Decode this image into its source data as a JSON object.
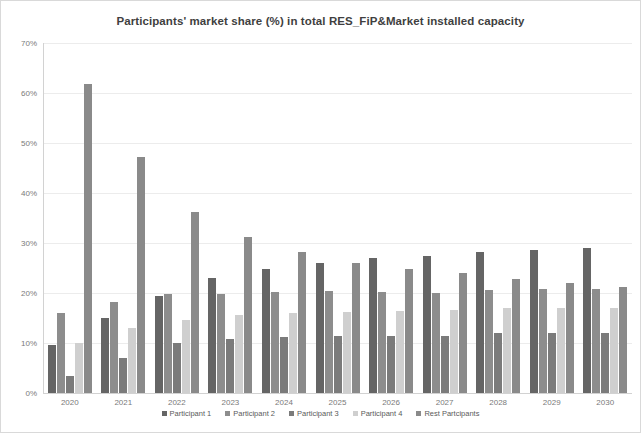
{
  "chart_data": {
    "type": "bar",
    "title": "Participants' market share (%) in total RES_FiP&Market installed capacity",
    "xlabel": "",
    "ylabel": "",
    "ylim": [
      0,
      70
    ],
    "yticks": [
      "0%",
      "10%",
      "20%",
      "30%",
      "40%",
      "50%",
      "60%",
      "70%"
    ],
    "ytick_values": [
      0,
      10,
      20,
      30,
      40,
      50,
      60,
      70
    ],
    "grid": true,
    "legend_position": "bottom",
    "categories": [
      "2020",
      "2021",
      "2022",
      "2023",
      "2024",
      "2025",
      "2026",
      "2027",
      "2028",
      "2029",
      "2030"
    ],
    "series": [
      {
        "name": "Participant 1",
        "color": "#656565",
        "values": [
          9.7,
          15.0,
          19.5,
          23.0,
          24.8,
          26.0,
          27.0,
          27.5,
          28.2,
          28.7,
          29.0
        ]
      },
      {
        "name": "Participant 2",
        "color": "#8d8d8d",
        "values": [
          16.0,
          18.3,
          19.8,
          19.9,
          20.2,
          20.5,
          20.3,
          20.1,
          20.6,
          20.8,
          20.8
        ]
      },
      {
        "name": "Participant 3",
        "color": "#7b7b7b",
        "values": [
          3.5,
          7.0,
          10.0,
          10.8,
          11.3,
          11.5,
          11.4,
          11.4,
          12.0,
          12.0,
          12.0
        ]
      },
      {
        "name": "Participant 4",
        "color": "#cfcfcf",
        "values": [
          10.0,
          13.0,
          14.7,
          15.7,
          16.1,
          16.3,
          16.4,
          16.6,
          17.0,
          17.0,
          17.0
        ]
      },
      {
        "name": "Rest Partcipants",
        "color": "#8a8a8a",
        "values": [
          61.8,
          47.3,
          36.3,
          31.2,
          28.2,
          26.0,
          24.9,
          24.0,
          22.9,
          22.1,
          21.3
        ]
      }
    ]
  }
}
